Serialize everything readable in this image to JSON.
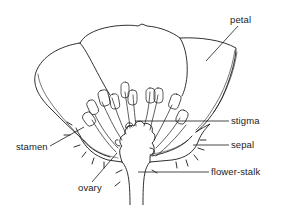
{
  "diagram": {
    "line_color": "#1a1a1a",
    "background": "#ffffff",
    "labels": [
      {
        "id": "petal",
        "text": "petal"
      },
      {
        "id": "stigma",
        "text": "stigma"
      },
      {
        "id": "sepal",
        "text": "sepal"
      },
      {
        "id": "stamen",
        "text": "stamen"
      },
      {
        "id": "flower-stalk",
        "text": "flower-stalk"
      },
      {
        "id": "ovary",
        "text": "ovary"
      }
    ]
  }
}
